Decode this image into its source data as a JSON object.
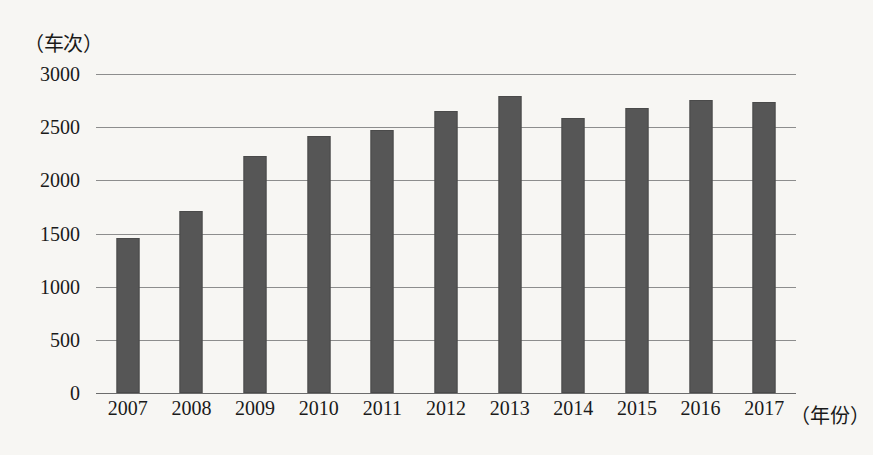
{
  "chart_data": {
    "type": "bar",
    "title": "",
    "subtitle": "",
    "xlabel": "（年份）",
    "ylabel": "（车次）",
    "categories": [
      "2007",
      "2008",
      "2009",
      "2010",
      "2011",
      "2012",
      "2013",
      "2014",
      "2015",
      "2016",
      "2017"
    ],
    "values": [
      1460,
      1710,
      2230,
      2420,
      2470,
      2650,
      2790,
      2590,
      2680,
      2760,
      2740
    ],
    "ylim": [
      0,
      3000
    ],
    "yticks": [
      0,
      500,
      1000,
      1500,
      2000,
      2500,
      3000
    ],
    "ytick_labels": [
      "0",
      "500",
      "1000",
      "1500",
      "2000",
      "2500",
      "3000"
    ],
    "grid": true,
    "legend": "none",
    "bar_color": "#565656",
    "grid_color": "#8d8d8d",
    "background_color": "#f7f6f3"
  }
}
